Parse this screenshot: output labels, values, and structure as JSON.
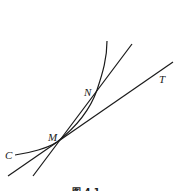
{
  "figure": {
    "caption": "图 4.1",
    "labels": {
      "curve": "C",
      "point_m": "M",
      "point_n": "N",
      "tangent": "T"
    },
    "colors": {
      "stroke": "#1a1a1a",
      "background": "#ffffff"
    }
  }
}
